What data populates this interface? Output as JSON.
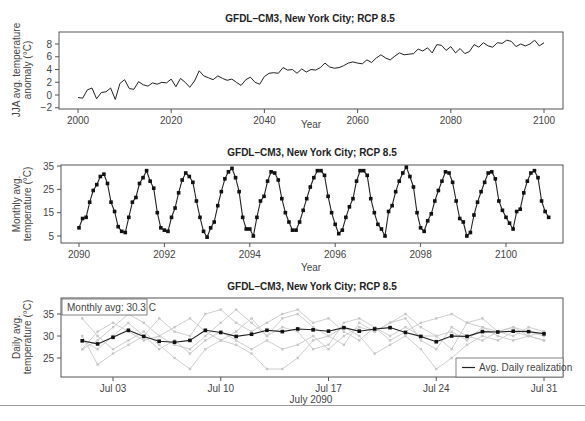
{
  "chart_data": [
    {
      "type": "line",
      "title": "GFDL–CM3, New York City; RCP 8.5",
      "xlabel": "Year",
      "ylabel": "JJA avg. temperature anomaly (°C)",
      "xlim": [
        1996,
        2104
      ],
      "ylim": [
        -2,
        10
      ],
      "xticks": [
        2000,
        2020,
        2040,
        2060,
        2080,
        2100
      ],
      "yticks": [
        -2,
        0,
        2,
        4,
        6,
        8
      ],
      "grid": false,
      "x_start": 2000,
      "x_step": 1,
      "values": [
        -0.4,
        -0.5,
        0.8,
        1.1,
        -0.6,
        0.4,
        0.5,
        1.1,
        -0.7,
        1.8,
        2.4,
        1.0,
        0.9,
        2.1,
        1.6,
        1.4,
        1.9,
        1.7,
        2.0,
        1.9,
        2.5,
        1.3,
        2.6,
        2.0,
        1.2,
        2.2,
        3.8,
        3.0,
        2.7,
        2.4,
        3.0,
        2.6,
        2.3,
        2.5,
        2.0,
        1.5,
        2.4,
        2.8,
        2.0,
        1.7,
        2.9,
        3.4,
        3.5,
        3.4,
        4.3,
        3.9,
        4.0,
        3.4,
        4.1,
        3.6,
        4.0,
        3.9,
        4.3,
        5.0,
        4.4,
        4.2,
        4.3,
        4.6,
        5.0,
        5.2,
        5.0,
        4.9,
        5.5,
        5.1,
        5.8,
        6.3,
        5.8,
        5.5,
        6.1,
        6.6,
        6.3,
        6.4,
        6.5,
        7.2,
        6.9,
        7.4,
        6.6,
        7.9,
        7.8,
        7.0,
        7.6,
        6.6,
        7.3,
        6.5,
        6.8,
        7.9,
        7.5,
        8.2,
        7.7,
        7.5,
        8.2,
        8.1,
        8.6,
        8.4,
        7.6,
        8.0,
        7.7,
        8.0,
        8.6,
        7.7,
        8.2
      ]
    },
    {
      "type": "line",
      "title": "GFDL–CM3, New York City; RCP 8.5",
      "xlabel": "Year",
      "ylabel": "Monthly avg. temperature (°C)",
      "xlim": [
        2089.6,
        2101.4
      ],
      "ylim": [
        2,
        36
      ],
      "xticks": [
        2090,
        2092,
        2094,
        2096,
        2098,
        2100
      ],
      "yticks": [
        5,
        15,
        25,
        35
      ],
      "grid": false,
      "markers": "square",
      "x_start": 2090.0,
      "x_step": 0.08333,
      "values": [
        8.5,
        12.5,
        13,
        19.5,
        24.5,
        27,
        30.5,
        31.5,
        27.5,
        19.5,
        15.5,
        9,
        7,
        6.5,
        13,
        19.5,
        21.5,
        27.5,
        30,
        33,
        28.5,
        25.5,
        15,
        8.5,
        7.5,
        7,
        13,
        17,
        23.5,
        29,
        32,
        30.5,
        28,
        20,
        13,
        7,
        4.5,
        8.5,
        11,
        18,
        24,
        29.5,
        32.5,
        34,
        30,
        24,
        13,
        8,
        8,
        5,
        13,
        20,
        22,
        28.5,
        32.5,
        32,
        29,
        21,
        15,
        11,
        7.5,
        7.5,
        11,
        16,
        21,
        26,
        30,
        33,
        33,
        31,
        22,
        15,
        10,
        6,
        7.5,
        13,
        17.5,
        21,
        28.5,
        33,
        33,
        31,
        21,
        15,
        10,
        8,
        5,
        15.5,
        18,
        24,
        28.5,
        32,
        34.5,
        30.5,
        26,
        15,
        8.5,
        7,
        11.5,
        14.5,
        20,
        24.5,
        28.5,
        32.5,
        32,
        28,
        20,
        12.5,
        11,
        5,
        6.5,
        14,
        19.5,
        24,
        28,
        32,
        32.5,
        29.5,
        20,
        16,
        13,
        10.5,
        8,
        15.5,
        16.5,
        23.5,
        28.5,
        32,
        33,
        30,
        20,
        15.5,
        13
      ]
    },
    {
      "type": "line",
      "title": "GFDL–CM3, New York City; RCP 8.5",
      "xlabel": "July 2090",
      "ylabel": "Daily avg. temperature (°C)",
      "xlim": [
        0,
        32
      ],
      "ylim": [
        20.5,
        38.5
      ],
      "xticks": [
        "Jul 03",
        "Jul 10",
        "Jul 17",
        "Jul 24",
        "Jul 31"
      ],
      "xtick_days": [
        3,
        10,
        17,
        24,
        31
      ],
      "yticks": [
        25,
        30,
        35
      ],
      "grid": false,
      "annotation": "Monthly avg: 30.3 C",
      "legend": {
        "position": "lower right",
        "entries": [
          "Avg. Daily realization"
        ]
      },
      "days": [
        1,
        2,
        3,
        4,
        5,
        6,
        7,
        8,
        9,
        10,
        11,
        12,
        13,
        14,
        15,
        16,
        17,
        18,
        19,
        20,
        21,
        22,
        23,
        24,
        25,
        26,
        27,
        28,
        29,
        30,
        31
      ],
      "series": [
        {
          "name": "Avg. Daily realization",
          "color": "#222222",
          "values": [
            28.9,
            28.2,
            29.7,
            31.3,
            29.9,
            28.8,
            28.6,
            29.0,
            31.3,
            30.8,
            29.9,
            30.4,
            31.3,
            31.0,
            31.6,
            31.4,
            31.1,
            31.9,
            31.1,
            31.6,
            31.9,
            30.8,
            29.9,
            28.7,
            30.0,
            29.9,
            31.0,
            30.9,
            31.1,
            31.0,
            30.5
          ]
        },
        {
          "name": "realization-1",
          "color": "#c8c8c8",
          "values": [
            27,
            29,
            32,
            35,
            33,
            30,
            28,
            27,
            30,
            33,
            36,
            33,
            30,
            34,
            35,
            32,
            30,
            28,
            33,
            31,
            33,
            35,
            32,
            30,
            27,
            33,
            34,
            31,
            32,
            30,
            31
          ]
        },
        {
          "name": "realization-2",
          "color": "#c8c8c8",
          "values": [
            34,
            30,
            27,
            29,
            31,
            28,
            25,
            22.5,
            27,
            29,
            28,
            26,
            22.5,
            22.5,
            25,
            29,
            30,
            32,
            30,
            26,
            28,
            30,
            27,
            22.5,
            25,
            28,
            30,
            29,
            31,
            30,
            29
          ]
        },
        {
          "name": "realization-3",
          "color": "#c8c8c8",
          "values": [
            30,
            23.5,
            26,
            28,
            30,
            34,
            31,
            30,
            35,
            36,
            33,
            31,
            33,
            35,
            36,
            33,
            34,
            31,
            29,
            32,
            29,
            31,
            33,
            34,
            35,
            33,
            32,
            31,
            30,
            32,
            31
          ]
        },
        {
          "name": "realization-4",
          "color": "#c8c8c8",
          "values": [
            29,
            27,
            30,
            33,
            30,
            27,
            29,
            26,
            29,
            31,
            29,
            27,
            29,
            27,
            28,
            30,
            27,
            30,
            32,
            31,
            33,
            34,
            29,
            27,
            32,
            30,
            29,
            31,
            32,
            31,
            30
          ]
        },
        {
          "name": "realization-5",
          "color": "#c8c8c8",
          "values": [
            27,
            31,
            33,
            31,
            29,
            30,
            32,
            34,
            31,
            29,
            31,
            34,
            30,
            32,
            31,
            27,
            28,
            33,
            34,
            32,
            30,
            32,
            30,
            30,
            31,
            29,
            32,
            30,
            29,
            30,
            29
          ]
        }
      ]
    }
  ]
}
